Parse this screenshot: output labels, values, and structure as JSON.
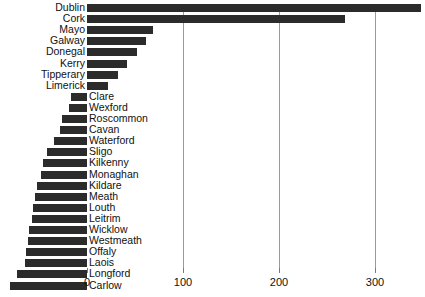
{
  "chart_data": {
    "type": "bar",
    "orientation": "horizontal",
    "title": "",
    "xlabel": "",
    "ylabel": "",
    "xlim": [
      0,
      350
    ],
    "grid": true,
    "legend": false,
    "xticks": [
      0,
      100,
      200,
      300
    ],
    "xticklabels": [
      "0",
      "100",
      "200",
      "300"
    ],
    "categories": [
      "Dublin",
      "Cork",
      "Mayo",
      "Galway",
      "Donegal",
      "Kerry",
      "Tipperary",
      "Limerick",
      "Clare",
      "Wexford",
      "Roscommon",
      "Cavan",
      "Waterford",
      "Sligo",
      "Kilkenny",
      "Monaghan",
      "Kildare",
      "Meath",
      "Louth",
      "Leitrim",
      "Wicklow",
      "Westmeath",
      "Offaly",
      "Laois",
      "Longford",
      "Carlow"
    ],
    "values": [
      348,
      269,
      69,
      61,
      52,
      42,
      32,
      22,
      17,
      19,
      26,
      28,
      34,
      42,
      46,
      48,
      52,
      54,
      56,
      57,
      60,
      61,
      64,
      65,
      73,
      80
    ],
    "bar_color": "#2b2b2b",
    "grid_color": "#9b9b9b",
    "background": "#ffffff"
  },
  "render": {
    "axis_zero_x": 87,
    "px_per_unit": 0.96,
    "row_pitch": 11.1,
    "first_row_top": 3,
    "right_group_count": 8
  }
}
